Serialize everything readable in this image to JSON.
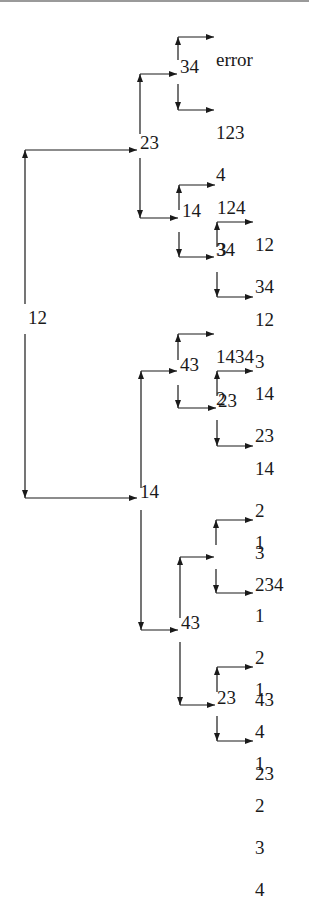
{
  "diagram": {
    "type": "binary decision tree (left-to-right, branches up/down)",
    "root": {
      "label": "12",
      "up": {
        "label": "23",
        "up": {
          "label": "34",
          "up": {
            "lines": [
              "error"
            ]
          },
          "down": {
            "lines": [
              "123",
              "4"
            ]
          }
        },
        "down": {
          "label": "14",
          "up": {
            "lines": [
              "124",
              "3"
            ]
          },
          "down": {
            "label": "34",
            "up": {
              "lines": [
                "12",
                "34"
              ]
            },
            "down": {
              "lines": [
                "12",
                "3"
              ]
            }
          }
        }
      },
      "down": {
        "label": "14",
        "up": {
          "label": "43",
          "up": {
            "lines": [
              "1434",
              "2"
            ]
          },
          "down": {
            "label": "23",
            "up": {
              "lines": [
                "14",
                "23"
              ]
            },
            "down": {
              "lines": [
                "14",
                "2",
                "3"
              ]
            }
          }
        },
        "down": {
          "label": "43",
          "up": {
            "label": "",
            "up": {
              "lines": [
                "1",
                "234"
              ]
            },
            "down": {
              "lines": [
                "1",
                "2",
                "43"
              ]
            }
          },
          "down": {
            "label": "23",
            "up": {
              "lines": [
                "1",
                "4",
                "23"
              ]
            },
            "down": {
              "lines": [
                "1",
                "2",
                "3",
                "4"
              ]
            }
          }
        }
      }
    }
  },
  "colors": {
    "line": "#1a1a1a",
    "background": "#ffffff",
    "top_border": "#9a9a9a"
  }
}
